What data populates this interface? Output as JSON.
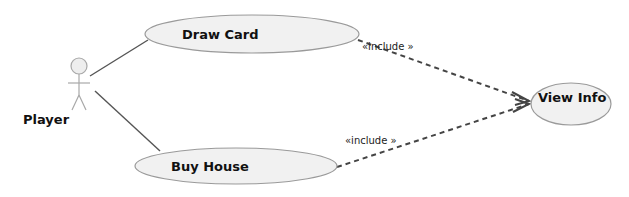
{
  "diagram": {
    "type": "uml-use-case",
    "actor": {
      "label": "Player"
    },
    "use_cases": [
      {
        "id": "draw_card",
        "label": "Draw Card"
      },
      {
        "id": "buy_house",
        "label": "Buy House"
      },
      {
        "id": "view_info",
        "label": "View Info"
      }
    ],
    "associations": [
      {
        "from": "Player",
        "to": "Draw Card"
      },
      {
        "from": "Player",
        "to": "Buy House"
      }
    ],
    "dependencies": [
      {
        "from": "Draw Card",
        "to": "View Info",
        "label": "«include »"
      },
      {
        "from": "Buy House",
        "to": "View Info",
        "label": "«include »"
      }
    ],
    "colors": {
      "ellipse_fill": "#f1f1f1",
      "ellipse_stroke": "#9a9a9a",
      "line": "#555555",
      "text": "#111111"
    }
  }
}
